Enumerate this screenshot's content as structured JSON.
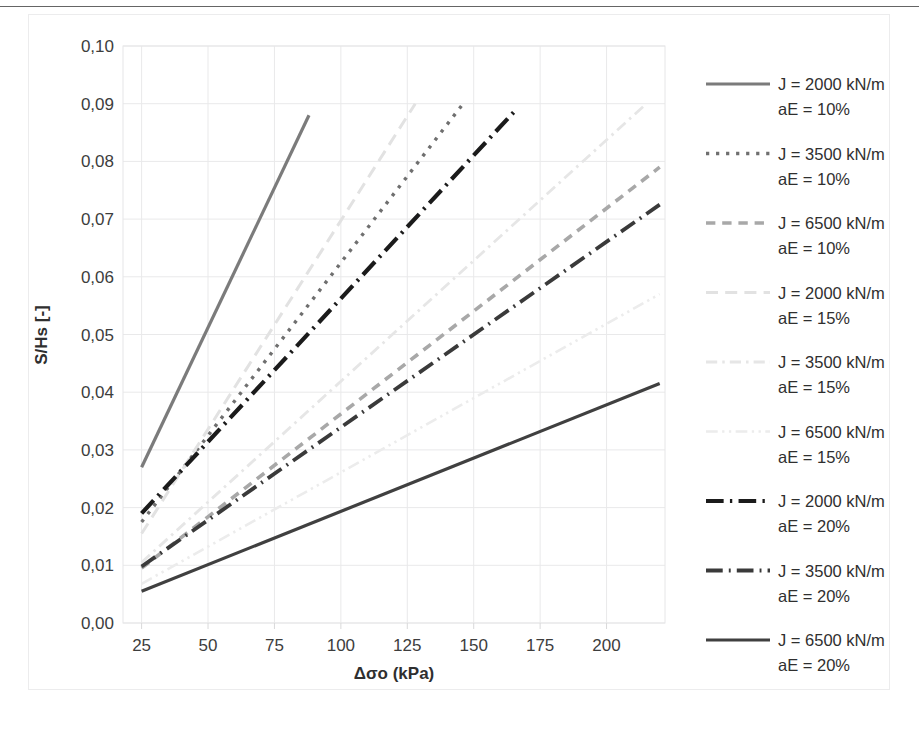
{
  "chart_data": {
    "type": "line",
    "title": "",
    "xlabel": "Δσo (kPa)",
    "ylabel": "S/Hs [-]",
    "xlim": [
      18,
      222
    ],
    "ylim": [
      0.0,
      0.1
    ],
    "xticks": [
      25,
      50,
      75,
      100,
      125,
      150,
      175,
      200
    ],
    "xtick_labels": [
      "25",
      "50",
      "75",
      "100",
      "125",
      "150",
      "175",
      "200"
    ],
    "yticks": [
      0.0,
      0.01,
      0.02,
      0.03,
      0.04,
      0.05,
      0.06,
      0.07,
      0.08,
      0.09,
      0.1
    ],
    "ytick_labels": [
      "0,00",
      "0,01",
      "0,02",
      "0,03",
      "0,04",
      "0,05",
      "0,06",
      "0,07",
      "0,08",
      "0,09",
      "0,10"
    ],
    "grid": true,
    "legend_position": "right",
    "decimal_separator": ",",
    "series": [
      {
        "name": "J = 2000 kN/m aE = 10%",
        "J": "2000 kN/m",
        "aE": "10%",
        "color": "#7b7b7b",
        "dash": "none",
        "width": 3.2,
        "x": [
          25,
          88
        ],
        "y": [
          0.027,
          0.088
        ]
      },
      {
        "name": "J = 3500 kN/m aE = 10%",
        "J": "3500 kN/m",
        "aE": "10%",
        "color": "#6f6f6f",
        "dash": "dotted",
        "width": 3.4,
        "x": [
          25,
          146
        ],
        "y": [
          0.0175,
          0.09
        ]
      },
      {
        "name": "J = 6500 kN/m aE = 10%",
        "J": "6500 kN/m",
        "aE": "10%",
        "color": "#a8a8a8",
        "dash": "dashed",
        "width": 3.6,
        "x": [
          25,
          220
        ],
        "y": [
          0.0095,
          0.079
        ]
      },
      {
        "name": "J = 2000 kN/m aE = 15%",
        "J": "2000 kN/m",
        "aE": "15%",
        "color": "#e2e2e2",
        "dash": "long-dash",
        "width": 3.0,
        "x": [
          25,
          128
        ],
        "y": [
          0.0155,
          0.09
        ]
      },
      {
        "name": "J = 3500 kN/m aE = 15%",
        "J": "3500 kN/m",
        "aE": "15%",
        "color": "#e6e6e6",
        "dash": "dash-dot",
        "width": 2.8,
        "x": [
          25,
          215
        ],
        "y": [
          0.0105,
          0.09
        ]
      },
      {
        "name": "J = 6500 kN/m aE = 15%",
        "J": "6500 kN/m",
        "aE": "15%",
        "color": "#ececec",
        "dash": "dash-dot-dot",
        "width": 2.6,
        "x": [
          25,
          220
        ],
        "y": [
          0.0068,
          0.057
        ]
      },
      {
        "name": "J = 2000 kN/m aE = 20%",
        "J": "2000 kN/m",
        "aE": "20%",
        "color": "#1b1b1b",
        "dash": "dash-dot-heavy",
        "width": 4.2,
        "x": [
          25,
          165
        ],
        "y": [
          0.019,
          0.0885
        ]
      },
      {
        "name": "J = 3500 kN/m aE = 20%",
        "J": "3500 kN/m",
        "aE": "20%",
        "color": "#3a3a3a",
        "dash": "dash-dot-medium",
        "width": 3.8,
        "x": [
          25,
          220
        ],
        "y": [
          0.0098,
          0.0725
        ]
      },
      {
        "name": "J = 6500 kN/m aE = 20%",
        "J": "6500 kN/m",
        "aE": "20%",
        "color": "#404040",
        "dash": "none",
        "width": 3.2,
        "x": [
          25,
          220
        ],
        "y": [
          0.0055,
          0.0415
        ]
      }
    ]
  },
  "axes": {
    "y_title": "S/Hs [-]",
    "x_title": "Δσo (kPa)",
    "ytick_0": "0,10",
    "ytick_1": "0,09",
    "ytick_2": "0,08",
    "ytick_3": "0,07",
    "ytick_4": "0,06",
    "ytick_5": "0,05",
    "ytick_6": "0,04",
    "ytick_7": "0,03",
    "ytick_8": "0,02",
    "ytick_9": "0,01",
    "ytick_10": "0,00",
    "xtick_0": "25",
    "xtick_1": "50",
    "xtick_2": "75",
    "xtick_3": "100",
    "xtick_4": "125",
    "xtick_5": "150",
    "xtick_6": "175",
    "xtick_7": "200"
  },
  "legend": {
    "items": [
      {
        "line1": "J = 2000 kN/m",
        "line2": "aE = 10%"
      },
      {
        "line1": "J = 3500 kN/m",
        "line2": "aE = 10%"
      },
      {
        "line1": "J = 6500 kN/m",
        "line2": "aE = 10%"
      },
      {
        "line1": "J = 2000 kN/m",
        "line2": "aE = 15%"
      },
      {
        "line1": "J = 3500 kN/m",
        "line2": "aE = 15%"
      },
      {
        "line1": "J = 6500 kN/m",
        "line2": "aE = 15%"
      },
      {
        "line1": "J = 2000 kN/m",
        "line2": "aE = 20%"
      },
      {
        "line1": "J = 3500 kN/m",
        "line2": "aE = 20%"
      },
      {
        "line1": "J = 6500 kN/m",
        "line2": "aE = 20%"
      }
    ]
  }
}
